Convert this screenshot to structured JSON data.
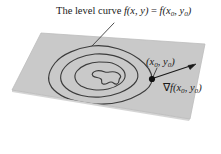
{
  "figure": {
    "labels": {
      "level_curve_prefix": "The level curve ",
      "level_curve_expr_f": "f",
      "level_curve_expr_args1": "(x, y)",
      "level_curve_equals": " = ",
      "level_curve_expr_f2": "f",
      "level_curve_args2_open": "(x",
      "level_curve_args2_sub1": "0",
      "level_curve_args2_mid": ", y",
      "level_curve_args2_sub2": "0",
      "level_curve_args2_close": ")",
      "level_curve_full": "The level curve f(x, y) = f(x0, y0)",
      "point_open": "(x",
      "point_sub1": "0",
      "point_mid": ", y",
      "point_sub2": "0",
      "point_close": ")",
      "point_full": "(x0, y0)",
      "gradient_nabla": "∇",
      "gradient_f": "f",
      "gradient_open": "(x",
      "gradient_sub1": "0",
      "gradient_mid": ", y",
      "gradient_sub2": "0",
      "gradient_close": ")",
      "gradient_full": "∇f(x0, y0)"
    },
    "colors": {
      "plane_fill": "#c9c9c9",
      "plane_edge": "#b4b4b4",
      "contour_stroke": "#3c3c3c",
      "leader_stroke": "#3c3c3c",
      "arrow_stroke": "#1a1a1a",
      "point_dot": "#111111",
      "background": "#ffffff",
      "text": "#1a1a1a"
    },
    "geometry": {
      "plane_polygon": "41,33 205,44 190,119 12,90",
      "point_dot_xy": [
        152,
        79
      ],
      "point_dot_radius": 3.1,
      "arrow_start": [
        154,
        78
      ],
      "arrow_end": [
        196,
        64
      ],
      "leader_start": [
        114,
        23
      ],
      "leader_end": [
        92,
        46
      ],
      "point_leader_start": [
        156,
        68
      ],
      "point_leader_end": [
        152,
        77
      ]
    }
  }
}
